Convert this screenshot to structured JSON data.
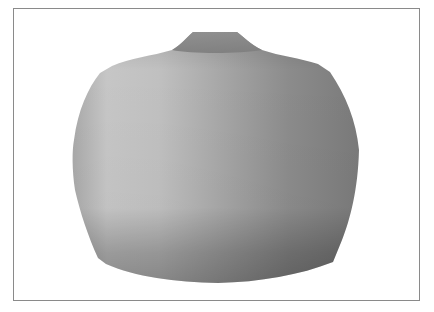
{
  "figure": {
    "colors": {
      "background": "#ffffff",
      "border": "#8a8a8a",
      "highlight": "#c8c8c8",
      "midtone": "#9a9a9a",
      "shadow": "#6e6e6e",
      "neck": "#858585"
    }
  }
}
